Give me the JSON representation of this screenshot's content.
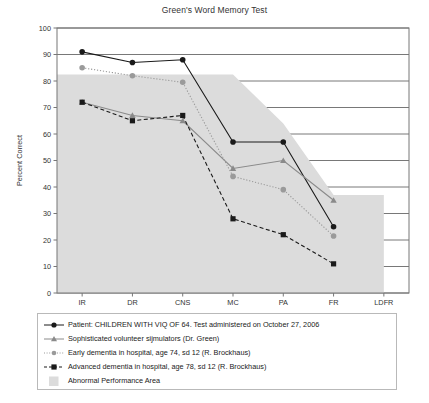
{
  "chart_data": {
    "type": "line",
    "title": "Green's Word Memory Test",
    "xlabel": "",
    "ylabel": "Percent Correct",
    "categories": [
      "IR",
      "DR",
      "CNS",
      "MC",
      "PA",
      "FR",
      "LDFR"
    ],
    "ylim": [
      0,
      100
    ],
    "yticks": [
      0,
      10,
      20,
      30,
      40,
      50,
      60,
      70,
      80,
      90,
      100
    ],
    "grid": "horizontal",
    "legend_position": "below",
    "series": [
      {
        "name": "Patient: CHILDREN WITH VIQ OF 64. Test administered on October 27, 2006",
        "marker": "circle",
        "color": "#1a1a1a",
        "linestyle": "solid",
        "values": [
          91,
          87,
          88,
          57,
          57,
          25,
          null
        ]
      },
      {
        "name": "Sophisticated volunteer sijmulators (Dr. Green)",
        "marker": "triangle",
        "color": "#8a8a8a",
        "linestyle": "solid",
        "values": [
          72,
          67,
          65,
          47,
          50,
          35,
          null
        ]
      },
      {
        "name": "Early dementia in hospital, age 74, sd 12 (R. Brockhaus)",
        "marker": "circle",
        "color": "#9a9a9a",
        "linestyle": "dotted",
        "values": [
          85,
          82,
          79.5,
          44,
          39,
          21.5,
          null
        ]
      },
      {
        "name": "Advanced dementia in hospital, age 78, sd 12 (R. Brockhaus)",
        "marker": "square",
        "color": "#1a1a1a",
        "linestyle": "dashed",
        "values": [
          72,
          65,
          67,
          28,
          22,
          11,
          null
        ]
      }
    ],
    "shaded_region": {
      "name": "Abnormal Performance Area",
      "color": "#dcdcdc",
      "polygon": [
        {
          "x": "IR",
          "y": 82.5
        },
        {
          "x": "MC",
          "y": 82.5
        },
        {
          "x": "PA",
          "y": 64
        },
        {
          "x": "FR",
          "y": 37
        },
        {
          "x": "LDFR",
          "y": 37
        },
        {
          "x": "LDFR",
          "y": 0
        },
        {
          "x": "IR",
          "y": 0
        }
      ]
    }
  },
  "legend": {
    "entries": [
      {
        "key": "patient-series-key",
        "label": "Patient: CHILDREN WITH VIQ OF 64. Test administered on October 27, 2006"
      },
      {
        "key": "simulators-series-key",
        "label": "Sophisticated volunteer sijmulators (Dr. Green)"
      },
      {
        "key": "early-dementia-series-key",
        "label": "Early dementia in hospital, age 74, sd 12 (R. Brockhaus)"
      },
      {
        "key": "advanced-dementia-series-key",
        "label": "Advanced dementia in hospital, age 78, sd 12 (R. Brockhaus)"
      },
      {
        "key": "abnormal-area-key",
        "label": "Abnormal Performance Area"
      }
    ]
  },
  "colors": {
    "black_series": "#1a1a1a",
    "gray_triangle_series": "#8a8a8a",
    "gray_circle_series": "#9a9a9a",
    "shaded_area": "#dcdcdc",
    "gridline": "#555555",
    "frame": "#777777"
  }
}
